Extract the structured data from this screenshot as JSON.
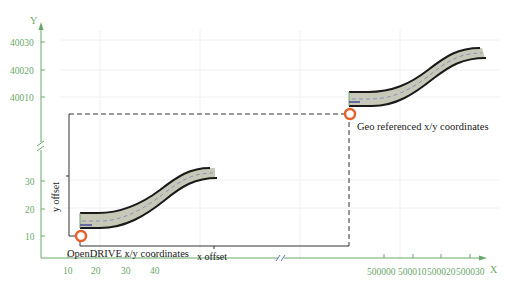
{
  "axes": {
    "x_label": "X",
    "y_label": "Y",
    "color": "#6aa86a",
    "x_ticks_local": [
      "10",
      "20",
      "30",
      "40"
    ],
    "x_ticks_geo": [
      "500000",
      "500010",
      "500020",
      "500030"
    ],
    "y_ticks_local": [
      "10",
      "20",
      "30"
    ],
    "y_ticks_geo": [
      "40010",
      "40020",
      "40030"
    ],
    "break_symbol": "//"
  },
  "labels": {
    "local_origin": "OpenDRIVE x/y coordinates",
    "geo_origin": "Geo referenced x/y coordinates",
    "x_offset": "x offset",
    "y_offset": "y offset"
  },
  "colors": {
    "road_fill": "#c8c8b8",
    "road_edge": "#1a1a1a",
    "centerline": "#8a94b8",
    "origin_marker": "#e8602c",
    "grid": "#eeeeee",
    "offset_line": "#333333"
  }
}
